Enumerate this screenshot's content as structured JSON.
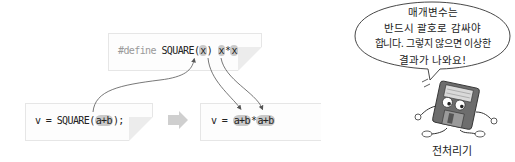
{
  "diagram": {
    "define_box": {
      "directive": "#define",
      "macro_name": "SQUARE",
      "open_paren": "(",
      "param": "x",
      "close_paren": ")",
      "body_left": "x",
      "body_op": "*",
      "body_right": "x"
    },
    "call_box": {
      "prefix": "v = SQUARE(",
      "arg": "a+b",
      "suffix": ");"
    },
    "expanded_box": {
      "prefix": "v = ",
      "left": "a+b",
      "op": "*",
      "right": "a+b"
    },
    "transform_arrow": "right-arrow-icon",
    "speech_bubble": {
      "lines": [
        "매개변수는",
        "반드시 괄호로 감싸야",
        "합니다. 그렇지 않으면 이상한",
        "결과가 나와요!"
      ]
    },
    "character": {
      "icon": "floppy-disk-character-icon",
      "label": "전처리기"
    },
    "colors": {
      "highlight": "#c9c9c9",
      "arrow_fill": "#cfcfcf",
      "box_border": "#e6e6e6",
      "curve": "#555555"
    }
  }
}
